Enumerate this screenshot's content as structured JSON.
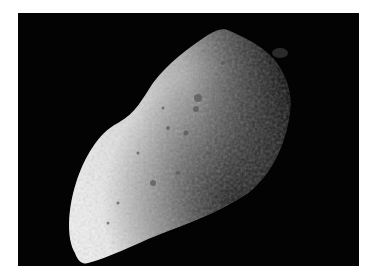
{
  "image": {
    "subject": "asteroid",
    "description": "Grayscale photograph of an elongated, cratered asteroid against a black background",
    "colors": {
      "background": "#030303",
      "border": "#ffffff",
      "lit_surface": "#e8e8e8",
      "mid_surface": "#9a9a9a",
      "shadow": "#1a1a1a"
    }
  }
}
